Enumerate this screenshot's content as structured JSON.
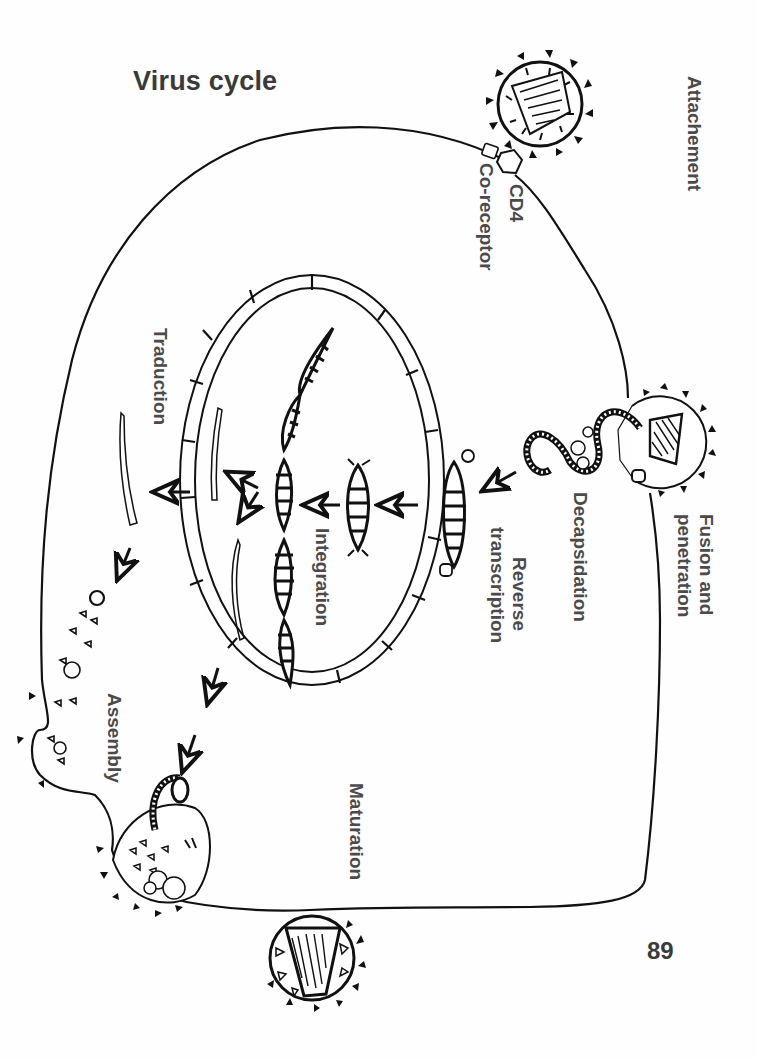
{
  "title": "Virus cycle",
  "page_number": "89",
  "labels": {
    "attachment": "Attachement",
    "cd4": "CD4",
    "co_receptor": "Co-receptor",
    "fusion_line1": "Fusion and",
    "fusion_line2": "penetration",
    "decapsidation": "Decapsidation",
    "reverse_line1": "Reverse",
    "reverse_line2": "transcription",
    "integration": "Integration",
    "traduction": "Traduction",
    "assembly": "Assembly",
    "maturation": "Maturation"
  },
  "colors": {
    "ink": "#111111",
    "label": "#4a4a4a",
    "background": "#fefefe"
  },
  "stages": [
    "Attachement",
    "Fusion and penetration",
    "Decapsidation",
    "Reverse transcription",
    "Integration",
    "Traduction",
    "Assembly",
    "Maturation"
  ]
}
